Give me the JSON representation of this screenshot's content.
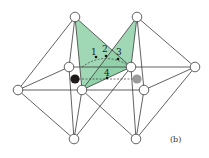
{
  "figure": {
    "panel_label": "(b)",
    "colors": {
      "face_fill": "#8fd1a8",
      "edge": "#3a3a3a",
      "node_fill": "#ffffff",
      "black_atom": "#1e1a1a",
      "grey_atom": "#9a9a9a"
    },
    "site_labels": [
      "1",
      "2",
      "3",
      "4"
    ]
  }
}
